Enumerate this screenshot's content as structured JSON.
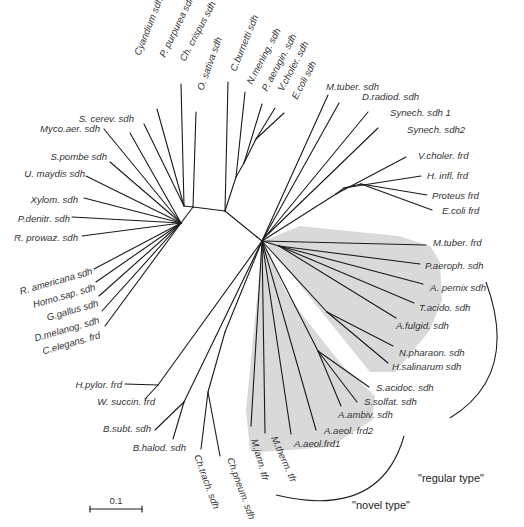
{
  "figure": {
    "type": "unrooted phylogenetic tree",
    "scale_bar": {
      "label": "0.1",
      "x1": 90,
      "x2": 142,
      "y": 509
    },
    "groups": [
      {
        "label": "\"regular type\"",
        "x": 418,
        "y": 482
      },
      {
        "label": "\"novel type\"",
        "x": 352,
        "y": 509
      }
    ],
    "shade_color": "#d9d9d9",
    "line_color": "#1a1a1a"
  },
  "taxa": [
    {
      "label": "Cyandium sdh",
      "x": 140,
      "y": 56,
      "rot": -68,
      "anchor": "start"
    },
    {
      "label": "P. purpurea sdh",
      "x": 165,
      "y": 58,
      "rot": -64,
      "anchor": "start"
    },
    {
      "label": "Ch. crispus sdh",
      "x": 185,
      "y": 62,
      "rot": -62,
      "anchor": "start"
    },
    {
      "label": "O. sativa sdh",
      "x": 203,
      "y": 91,
      "rot": -70,
      "anchor": "start"
    },
    {
      "label": "C.burnetti sdh",
      "x": 236,
      "y": 72,
      "rot": -68,
      "anchor": "start"
    },
    {
      "label": "N.mening. sdh",
      "x": 252,
      "y": 85,
      "rot": -62,
      "anchor": "start"
    },
    {
      "label": "P. aerugin. sdh",
      "x": 267,
      "y": 92,
      "rot": -62,
      "anchor": "start"
    },
    {
      "label": "V.choler. sdh",
      "x": 283,
      "y": 92,
      "rot": -62,
      "anchor": "start"
    },
    {
      "label": "E.coli sdh",
      "x": 297,
      "y": 100,
      "rot": -62,
      "anchor": "start"
    },
    {
      "label": "M.tuber. sdh",
      "x": 326,
      "y": 90,
      "rot": 0,
      "anchor": "start"
    },
    {
      "label": "D.radiod. sdh",
      "x": 362,
      "y": 100,
      "rot": 0,
      "anchor": "start"
    },
    {
      "label": "Synech. sdh 1",
      "x": 390,
      "y": 116,
      "rot": 0,
      "anchor": "start"
    },
    {
      "label": "Synech. sdh2",
      "x": 407,
      "y": 133,
      "rot": 0,
      "anchor": "start"
    },
    {
      "label": "V.choler. frd",
      "x": 418,
      "y": 159,
      "rot": 0,
      "anchor": "start"
    },
    {
      "label": "H. infl. frd",
      "x": 427,
      "y": 179,
      "rot": 0,
      "anchor": "start"
    },
    {
      "label": "Proteus frd",
      "x": 432,
      "y": 199,
      "rot": 0,
      "anchor": "start"
    },
    {
      "label": "E.coli frd",
      "x": 442,
      "y": 214,
      "rot": 0,
      "anchor": "start"
    },
    {
      "label": "M.tuber. frd",
      "x": 433,
      "y": 246,
      "rot": 0,
      "anchor": "start"
    },
    {
      "label": "P.aeroph. sdh",
      "x": 425,
      "y": 269,
      "rot": 0,
      "anchor": "start"
    },
    {
      "label": "A. pernix sdh",
      "x": 430,
      "y": 291,
      "rot": 0,
      "anchor": "start"
    },
    {
      "label": "T.acido. sdh",
      "x": 419,
      "y": 311,
      "rot": 0,
      "anchor": "start"
    },
    {
      "label": "A.fulgid. sdh",
      "x": 396,
      "y": 329,
      "rot": 0,
      "anchor": "start"
    },
    {
      "label": "N.pharaon. sdh",
      "x": 399,
      "y": 356,
      "rot": 0,
      "anchor": "start"
    },
    {
      "label": "H.salinarum sdh",
      "x": 392,
      "y": 370,
      "rot": 0,
      "anchor": "start"
    },
    {
      "label": "S.acidoc. sdh",
      "x": 376,
      "y": 391,
      "rot": 0,
      "anchor": "start"
    },
    {
      "label": "S.solfat. sdh",
      "x": 364,
      "y": 405,
      "rot": 0,
      "anchor": "start"
    },
    {
      "label": "A.ambiv. sdh",
      "x": 338,
      "y": 418,
      "rot": 0,
      "anchor": "start"
    },
    {
      "label": "A.aeol. frd2",
      "x": 324,
      "y": 434,
      "rot": 0,
      "anchor": "start"
    },
    {
      "label": "A.aeol.frd1",
      "x": 294,
      "y": 447,
      "rot": 0,
      "anchor": "start"
    },
    {
      "label": "M.jann. tfr",
      "x": 251,
      "y": 440,
      "rot": 74,
      "anchor": "start"
    },
    {
      "label": "M.therm. tfr",
      "x": 271,
      "y": 438,
      "rot": 66,
      "anchor": "start"
    },
    {
      "label": "Ch.pneum. sdh",
      "x": 227,
      "y": 459,
      "rot": 70,
      "anchor": "start"
    },
    {
      "label": "Ch.trach. sdh",
      "x": 194,
      "y": 456,
      "rot": 70,
      "anchor": "start"
    },
    {
      "label": "B.halod. sdh",
      "x": 186,
      "y": 451,
      "rot": 0,
      "anchor": "end"
    },
    {
      "label": "B.subt. sdh",
      "x": 151,
      "y": 432,
      "rot": 0,
      "anchor": "end"
    },
    {
      "label": "W. succin. frd",
      "x": 155,
      "y": 405,
      "rot": 0,
      "anchor": "end"
    },
    {
      "label": "H.pylor. frd",
      "x": 122,
      "y": 388,
      "rot": 0,
      "anchor": "end"
    },
    {
      "label": "C.elegans. frd",
      "x": 101,
      "y": 338,
      "rot": -16,
      "anchor": "end"
    },
    {
      "label": "D.melanog. sdh",
      "x": 100,
      "y": 323,
      "rot": -16,
      "anchor": "end"
    },
    {
      "label": "G.gallus sdh",
      "x": 99,
      "y": 306,
      "rot": -16,
      "anchor": "end"
    },
    {
      "label": "Homo.sap. sdh",
      "x": 96,
      "y": 290,
      "rot": -16,
      "anchor": "end"
    },
    {
      "label": "R. americana sdh",
      "x": 93,
      "y": 274,
      "rot": -16,
      "anchor": "end"
    },
    {
      "label": "R. prowaz. sdh",
      "x": 78,
      "y": 241,
      "rot": 0,
      "anchor": "end"
    },
    {
      "label": "P.denitr. sdh",
      "x": 70,
      "y": 222,
      "rot": 0,
      "anchor": "end"
    },
    {
      "label": "Xylom. sdh",
      "x": 78,
      "y": 203,
      "rot": 0,
      "anchor": "end"
    },
    {
      "label": "U. maydis sdh",
      "x": 85,
      "y": 177,
      "rot": 0,
      "anchor": "end"
    },
    {
      "label": "S.pombe sdh",
      "x": 107,
      "y": 160,
      "rot": 0,
      "anchor": "end"
    },
    {
      "label": "Myco.aer. sdh",
      "x": 100,
      "y": 132,
      "rot": 0,
      "anchor": "end"
    },
    {
      "label": "S. cerev. sdh",
      "x": 134,
      "y": 122,
      "rot": 0,
      "anchor": "end"
    }
  ],
  "branches": [
    [
      193,
      207,
      225,
      211
    ],
    [
      225,
      211,
      257,
      237
    ],
    [
      257,
      237,
      262,
      241
    ],
    [
      193,
      207,
      184,
      206
    ],
    [
      184,
      206,
      144,
      124
    ],
    [
      184,
      206,
      157,
      109
    ],
    [
      184,
      206,
      181,
      84
    ],
    [
      193,
      207,
      196,
      112
    ],
    [
      225,
      211,
      228,
      82
    ],
    [
      225,
      211,
      236,
      177
    ],
    [
      236,
      177,
      245,
      92
    ],
    [
      236,
      177,
      244,
      163
    ],
    [
      244,
      163,
      262,
      104
    ],
    [
      244,
      163,
      256,
      139
    ],
    [
      256,
      139,
      275,
      108
    ],
    [
      256,
      139,
      284,
      113
    ],
    [
      262,
      241,
      328,
      95
    ],
    [
      262,
      241,
      339,
      103
    ],
    [
      262,
      241,
      265,
      237
    ],
    [
      265,
      237,
      368,
      112
    ],
    [
      265,
      237,
      378,
      128
    ],
    [
      262,
      241,
      336,
      194
    ],
    [
      336,
      194,
      406,
      157
    ],
    [
      336,
      194,
      344,
      188
    ],
    [
      344,
      188,
      421,
      176
    ],
    [
      344,
      188,
      361,
      184
    ],
    [
      361,
      184,
      427,
      195
    ],
    [
      361,
      184,
      432,
      210
    ],
    [
      262,
      241,
      426,
      245
    ],
    [
      262,
      241,
      279,
      246
    ],
    [
      279,
      246,
      420,
      264
    ],
    [
      279,
      246,
      423,
      284
    ],
    [
      279,
      246,
      414,
      303
    ],
    [
      279,
      246,
      396,
      318
    ],
    [
      262,
      241,
      327,
      312
    ],
    [
      327,
      312,
      393,
      346
    ],
    [
      327,
      312,
      388,
      363
    ],
    [
      262,
      241,
      318,
      351
    ],
    [
      318,
      351,
      369,
      387
    ],
    [
      318,
      351,
      357,
      402
    ],
    [
      318,
      351,
      341,
      406
    ],
    [
      262,
      241,
      316,
      430
    ],
    [
      262,
      241,
      291,
      434
    ],
    [
      262,
      241,
      265,
      433
    ],
    [
      262,
      241,
      251,
      426
    ],
    [
      262,
      241,
      225,
      332
    ],
    [
      225,
      332,
      208,
      392
    ],
    [
      208,
      392,
      220,
      456
    ],
    [
      208,
      392,
      201,
      449
    ],
    [
      262,
      241,
      184,
      402
    ],
    [
      184,
      402,
      155,
      430
    ],
    [
      184,
      402,
      173,
      439
    ],
    [
      262,
      241,
      158,
      385
    ],
    [
      158,
      385,
      125,
      384
    ],
    [
      158,
      385,
      145,
      399
    ],
    [
      193,
      207,
      181,
      223
    ],
    [
      181,
      223,
      94,
      269
    ],
    [
      181,
      223,
      96,
      282
    ],
    [
      181,
      223,
      99,
      296
    ],
    [
      181,
      223,
      102,
      311
    ],
    [
      181,
      223,
      105,
      326
    ],
    [
      181,
      223,
      82,
      236
    ],
    [
      181,
      223,
      72,
      217
    ],
    [
      181,
      223,
      84,
      198
    ],
    [
      181,
      223,
      86,
      176
    ],
    [
      181,
      223,
      110,
      162
    ],
    [
      181,
      223,
      104,
      129
    ],
    [
      181,
      223,
      130,
      133
    ]
  ]
}
